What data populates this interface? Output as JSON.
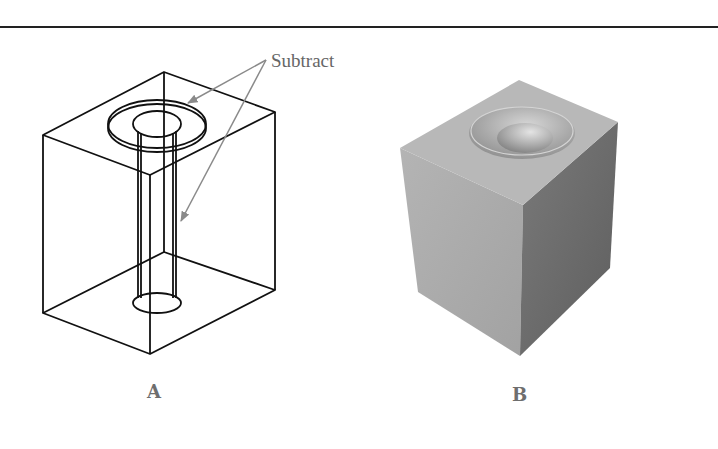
{
  "figure": {
    "callout": {
      "text": "Subtract",
      "color": "#7a7a7a"
    },
    "panels": [
      {
        "id": "A",
        "label": "A",
        "style": "wireframe",
        "description": "Wireframe box with counterbore and through-hole cylinders to subtract"
      },
      {
        "id": "B",
        "label": "B",
        "style": "shaded",
        "description": "Shaded solid cube with counterbored hole after subtraction"
      }
    ]
  },
  "colors": {
    "rule": "#222222",
    "wire": "#111111",
    "arrow": "#8a8a8a",
    "label": "#6e6e6e",
    "cube_top": "#b9b9b9",
    "cube_left": "#aeaeae",
    "cube_right": "#6d6d6d"
  }
}
